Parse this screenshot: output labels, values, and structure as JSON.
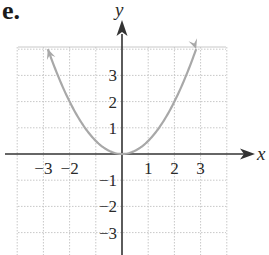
{
  "panel": {
    "label": "e."
  },
  "chart_data": {
    "type": "line",
    "title": "",
    "function": "y = x^2 / 2",
    "xlabel": "x",
    "ylabel": "y",
    "xlim": [
      -4,
      4
    ],
    "ylim": [
      -3.8,
      4
    ],
    "grid": true,
    "x_ticks": [
      "-3",
      "-2",
      "1",
      "2",
      "3"
    ],
    "y_ticks": [
      "3",
      "2",
      "1",
      "-1",
      "-2",
      "-3"
    ],
    "series": [
      {
        "name": "parabola",
        "color": "#a8a8a8",
        "arrows_at_ends": true,
        "x": [
          -2.83,
          -2.5,
          -2,
          -1.5,
          -1,
          -0.5,
          0,
          0.5,
          1,
          1.5,
          2,
          2.5,
          2.83
        ],
        "y": [
          4.0,
          3.125,
          2.0,
          1.125,
          0.5,
          0.125,
          0,
          0.125,
          0.5,
          1.125,
          2.0,
          3.125,
          4.0
        ]
      }
    ]
  },
  "colors": {
    "axis": "#333333",
    "grid": "#c8c8c8",
    "curve": "#a8a8a8"
  }
}
